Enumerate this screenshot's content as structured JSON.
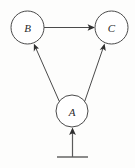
{
  "figure": {
    "type": "directed-graph",
    "title": "",
    "background_color": "#fdfdfc",
    "stroke_color": "#4a4a4a",
    "label_color": "#2b2b2b",
    "width": 135,
    "height": 168
  },
  "nodes": [
    {
      "id": "B",
      "label": "B",
      "cx": 27.5,
      "cy": 27.5,
      "r": 16.5
    },
    {
      "id": "C",
      "label": "C",
      "cx": 111.5,
      "cy": 27.5,
      "r": 16.5
    },
    {
      "id": "A",
      "label": "A",
      "cx": 72.0,
      "cy": 111.0,
      "r": 16.0
    }
  ],
  "edges": [
    {
      "id": "B-to-C",
      "from": "B",
      "to": "C",
      "style": "solid",
      "arrow": "single",
      "label": ""
    },
    {
      "id": "A-to-B",
      "from": "A",
      "to": "B",
      "style": "solid",
      "arrow": "single",
      "label": ""
    },
    {
      "id": "A-to-C",
      "from": "A",
      "to": "C",
      "style": "solid",
      "arrow": "single",
      "label": ""
    }
  ],
  "exogenous_input": {
    "id": "input-to-A",
    "target": "A",
    "arrow": "single",
    "base_bar": {
      "x1": 57,
      "x2": 88,
      "y": 157
    },
    "stem": {
      "x": 72.5,
      "y_bottom": 157,
      "y_top": 128
    }
  },
  "icons": {
    "arrowhead": "arrowhead-icon",
    "ground_bar": "ground-bar-icon"
  }
}
